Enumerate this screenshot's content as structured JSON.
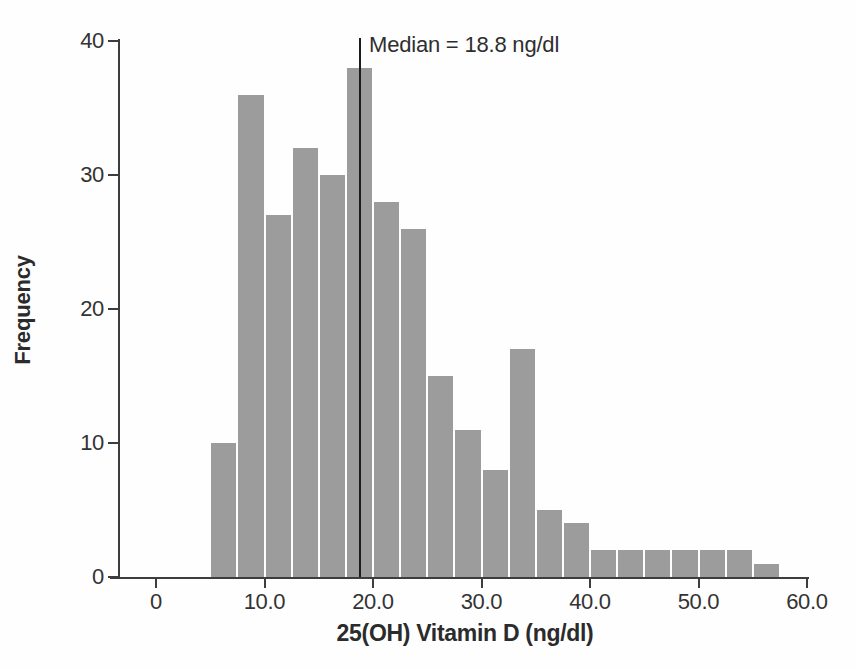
{
  "chart_data": {
    "type": "bar",
    "subtype": "histogram",
    "title": "",
    "xlabel": "25(OH) Vitamin D (ng/dl)",
    "ylabel": "Frequency",
    "bin_start": 5.0,
    "bin_width": 2.5,
    "bin_edges": [
      5.0,
      7.5,
      10.0,
      12.5,
      15.0,
      17.5,
      20.0,
      22.5,
      25.0,
      27.5,
      30.0,
      32.5,
      35.0,
      37.5,
      40.0,
      42.5,
      45.0,
      47.5,
      50.0,
      52.5,
      55.0,
      57.5
    ],
    "values": [
      10,
      36,
      27,
      32,
      30,
      38,
      28,
      26,
      15,
      11,
      8,
      17,
      5,
      4,
      2,
      2,
      2,
      2,
      2,
      2,
      1
    ],
    "x_ticks": [
      {
        "value": 0,
        "label": "0"
      },
      {
        "value": 10,
        "label": "10.0"
      },
      {
        "value": 20,
        "label": "20.0"
      },
      {
        "value": 30,
        "label": "30.0"
      },
      {
        "value": 40,
        "label": "40.0"
      },
      {
        "value": 50,
        "label": "50.0"
      },
      {
        "value": 60,
        "label": "60.0"
      }
    ],
    "y_ticks": [
      {
        "value": 0,
        "label": "0"
      },
      {
        "value": 10,
        "label": "10"
      },
      {
        "value": 20,
        "label": "20"
      },
      {
        "value": 30,
        "label": "30"
      },
      {
        "value": 40,
        "label": "40"
      }
    ],
    "xlim": [
      0,
      60
    ],
    "ylim": [
      0,
      40
    ],
    "grid": false,
    "legend": "none",
    "median": {
      "value": 18.8,
      "label": "Median = 18.8 ng/dl"
    },
    "colors": {
      "bar": "#9c9c9c",
      "axis": "#3d3d3d",
      "text": "#333333",
      "median_line": "#1c1c1c"
    }
  }
}
